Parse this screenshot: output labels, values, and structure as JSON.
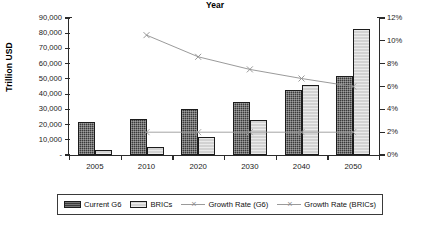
{
  "chart_data": {
    "type": "bar",
    "title": "",
    "xlabel": "Year",
    "ylabel": "Trillion USD",
    "ylabel_secondary": "Annual GDP Growth",
    "categories": [
      "2005",
      "2010",
      "2020",
      "2030",
      "2040",
      "2050"
    ],
    "ylim": [
      0,
      90000
    ],
    "ylim_secondary": [
      0,
      12
    ],
    "ytick_labels": [
      "90,000",
      "80,000",
      "70,000",
      "60,000",
      "50,000",
      "40,000",
      "30,000",
      "20,000",
      "10,000",
      "-"
    ],
    "ytick_values": [
      90000,
      80000,
      70000,
      60000,
      50000,
      40000,
      30000,
      20000,
      10000,
      0
    ],
    "ytick_labels_secondary": [
      "12%",
      "10%",
      "8%",
      "6%",
      "4%",
      "2%",
      "0%"
    ],
    "ytick_values_secondary": [
      12,
      10,
      8,
      6,
      4,
      2,
      0
    ],
    "grid": false,
    "legend_position": "bottom",
    "series": [
      {
        "name": "Current G6",
        "type": "bar",
        "axis": "left",
        "values": [
          22000,
          23500,
          30000,
          35000,
          43000,
          52000
        ]
      },
      {
        "name": "BRICs",
        "type": "bar",
        "axis": "left",
        "values": [
          3000,
          5000,
          12000,
          23000,
          46000,
          83000
        ]
      },
      {
        "name": "Growth Rate (G6)",
        "type": "line",
        "axis": "right",
        "marker": "x",
        "values": [
          null,
          2.0,
          2.0,
          2.0,
          2.0,
          2.0
        ]
      },
      {
        "name": "Growth Rate (BRICs)",
        "type": "line",
        "axis": "right",
        "marker": "x",
        "values": [
          null,
          10.5,
          8.6,
          7.5,
          6.7,
          6.0
        ]
      }
    ],
    "colors": {
      "current_g6": "#3a3a3a",
      "brics": "#d2d2d2",
      "growth_g6": "#9a9a9a",
      "growth_brics": "#8e8e8e",
      "axis": "#2b2b2b"
    }
  },
  "legend": {
    "items": [
      {
        "label": "Current G6",
        "swatch": "g6"
      },
      {
        "label": "BRICs",
        "swatch": "brics"
      },
      {
        "label": "Growth Rate (G6)",
        "swatch": "line"
      },
      {
        "label": "Growth Rate (BRICs)",
        "swatch": "line"
      }
    ]
  }
}
